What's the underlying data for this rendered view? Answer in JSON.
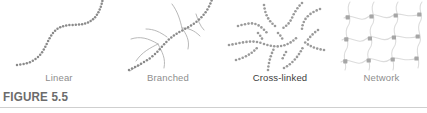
{
  "figure": {
    "caption": "FIGURE 5.5",
    "background_color": "#ffffff",
    "rule_color": "#cfcfcf"
  },
  "panels": [
    {
      "id": "linear",
      "label": "Linear",
      "label_color": "#8e8e8e",
      "emphasis": false,
      "bead_color": "#8a8a8a",
      "line_color": "#b8b8b8",
      "description": "single beaded S-shaped polymer chain"
    },
    {
      "id": "branched",
      "label": "Branched",
      "label_color": "#8e8e8e",
      "emphasis": false,
      "bead_color": "#8a8a8a",
      "line_color": "#b0b0b0",
      "description": "beaded backbone chain with smooth curved side branches"
    },
    {
      "id": "cross-linked",
      "label": "Cross-linked",
      "label_color": "#3b3b3b",
      "emphasis": true,
      "bead_color": "#9a9a9a",
      "line_color": "#b8b8b8",
      "description": "dense tangle of beaded chains joined at crosslink points"
    },
    {
      "id": "network",
      "label": "Network",
      "label_color": "#8e8e8e",
      "emphasis": false,
      "bead_color": "#9e9e9e",
      "line_color": "#dcdcdc",
      "description": "three by three lattice of square nodes joined by wavy strands"
    }
  ]
}
